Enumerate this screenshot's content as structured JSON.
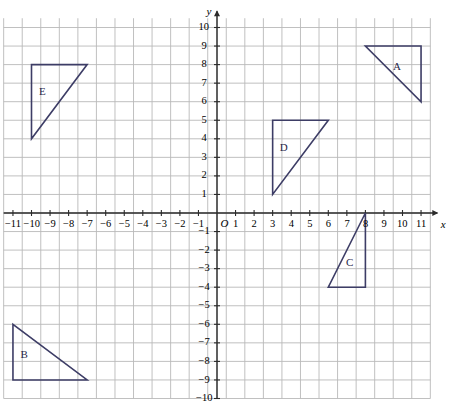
{
  "chart_data": {
    "type": "scatter",
    "title": "",
    "xlabel": "x",
    "ylabel": "y",
    "xlim": [
      -12,
      12
    ],
    "ylim": [
      -10,
      10.7
    ],
    "grid": true,
    "legend": "none",
    "origin_label": "O",
    "x_ticks": [
      -11,
      -10,
      -9,
      -8,
      -7,
      -6,
      -5,
      -4,
      -3,
      -2,
      -1,
      1,
      2,
      3,
      4,
      5,
      6,
      7,
      8,
      9,
      10,
      11
    ],
    "x_tick_labels": [
      "−11",
      "−10",
      "−9",
      "−8",
      "−7",
      "−6",
      "−5",
      "−4",
      "−3",
      "−2",
      "−1",
      "1",
      "2",
      "3",
      "4",
      "5",
      "6",
      "7",
      "8",
      "9",
      "10",
      "11"
    ],
    "y_ticks": [
      10,
      9,
      8,
      7,
      6,
      5,
      4,
      3,
      2,
      1,
      -1,
      -2,
      -3,
      -4,
      -5,
      -6,
      -7,
      -8,
      -9,
      -10
    ],
    "y_tick_labels": [
      "10",
      "9",
      "8",
      "7",
      "6",
      "5",
      "4",
      "3",
      "2",
      "1",
      "−1",
      "−2",
      "−3",
      "−4",
      "−5",
      "−6",
      "−7",
      "−8",
      "−9",
      "−10"
    ],
    "shape_color": "#3d3d66",
    "grid_color": "#b9b9b9",
    "axis_color": "#2b2b2b",
    "shapes": [
      {
        "label": "A",
        "vertices": [
          [
            8,
            9
          ],
          [
            11,
            9
          ],
          [
            11,
            6
          ]
        ],
        "label_pos": [
          9.7,
          7.9
        ]
      },
      {
        "label": "B",
        "vertices": [
          [
            -11,
            -6
          ],
          [
            -11,
            -9
          ],
          [
            -7,
            -9
          ]
        ],
        "label_pos": [
          -10.4,
          -7.6
        ]
      },
      {
        "label": "C",
        "vertices": [
          [
            8,
            0
          ],
          [
            8,
            -4
          ],
          [
            6,
            -4
          ]
        ],
        "label_pos": [
          7.15,
          -2.65
        ]
      },
      {
        "label": "D",
        "vertices": [
          [
            3,
            5
          ],
          [
            6,
            5
          ],
          [
            3,
            1
          ]
        ],
        "label_pos": [
          3.6,
          3.55
        ]
      },
      {
        "label": "E",
        "vertices": [
          [
            -10,
            8
          ],
          [
            -7,
            8
          ],
          [
            -10,
            4
          ]
        ],
        "label_pos": [
          -9.4,
          6.55
        ]
      }
    ]
  }
}
